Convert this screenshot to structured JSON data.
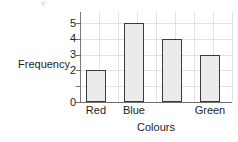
{
  "artifact": {
    "glyph": "y"
  },
  "chart_data": {
    "type": "bar",
    "title": "",
    "xlabel": "Colours",
    "ylabel": "Frequency",
    "categories": [
      "Red",
      "Blue",
      "",
      "Green"
    ],
    "values": [
      2,
      5,
      4,
      3
    ],
    "ylim": [
      0,
      5.7
    ],
    "ytick_labels": [
      "0",
      "1",
      "2",
      "3",
      "4",
      "5"
    ],
    "ytick_values": [
      0,
      1,
      2,
      3,
      4,
      5
    ],
    "grid": true,
    "legend": "none",
    "bar_fill_color": "#ebebeb",
    "bar_border_color": "#3a3a3a",
    "grid_color": "#e2e2e2",
    "axis_color": "#6f6f6f",
    "note_hidden_label": "1"
  }
}
